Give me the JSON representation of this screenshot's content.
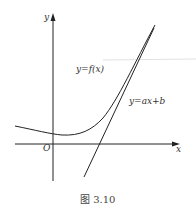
{
  "figure": {
    "caption": "图 3.10",
    "axis_labels": {
      "x": "x",
      "y": "y",
      "origin": "O"
    },
    "curve_label": "y=f(x)",
    "line_label": "y=ax+b"
  },
  "colors": {
    "stroke": "#222222",
    "guide": "#d8d8d8",
    "text": "#333333"
  }
}
